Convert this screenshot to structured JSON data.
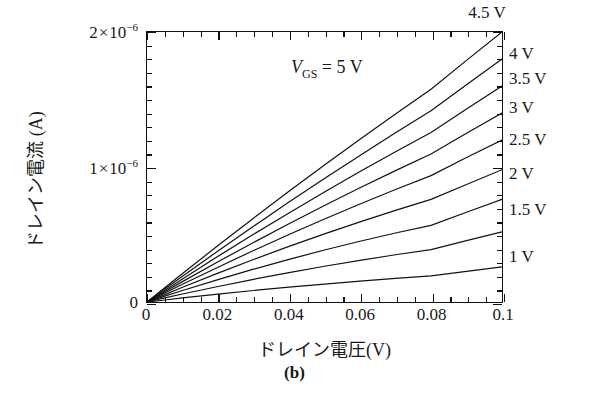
{
  "figure": {
    "panel_caption": "(b)",
    "x_axis_title": "ドレイン電圧(V)",
    "y_axis_title": "ドレイン電流 (A)",
    "annotation": {
      "symbol": "V",
      "subscript": "GS",
      "equals": " = 5 V"
    }
  },
  "axes": {
    "x_tick_labels": [
      "0",
      "0.02",
      "0.04",
      "0.06",
      "0.08",
      "0.1"
    ],
    "y_tick_labels": [
      {
        "mantissa": "0",
        "show_power": false,
        "exponent": ""
      },
      {
        "mantissa": "1",
        "show_power": true,
        "exponent": "−6"
      },
      {
        "mantissa": "2",
        "show_power": true,
        "exponent": "−6"
      }
    ],
    "times_glyph": "×",
    "base": "10"
  },
  "chart_data": {
    "type": "line",
    "title": "",
    "xlabel": "ドレイン電圧(V)",
    "ylabel": "ドレイン電流 (A)",
    "xlim": [
      0,
      0.1
    ],
    "ylim": [
      0,
      2e-06
    ],
    "xticks": [
      0,
      0.02,
      0.04,
      0.06,
      0.08,
      0.1
    ],
    "yticks": [
      0,
      1e-06,
      2e-06
    ],
    "x_minor_step": 0.005,
    "y_minor_step": 1e-07,
    "grid": false,
    "legend": "curve-end-labels-right",
    "x": [
      0,
      0.005,
      0.01,
      0.02,
      0.03,
      0.04,
      0.05,
      0.06,
      0.07,
      0.08,
      0.09,
      0.1
    ],
    "series": [
      {
        "name": "5 V",
        "label": "4.5 V",
        "label_note": "topmost curve is VGS = 5 V, annotated inside plot",
        "values": [
          0,
          1.06e-07,
          2.11e-07,
          4.18e-07,
          6.21e-07,
          8.2e-07,
          1.015e-06,
          1.206e-06,
          1.393e-06,
          1.576e-06,
          1.79e-06,
          2e-06
        ]
      },
      {
        "name": "4.5 V",
        "label": "4.5 V",
        "values": [
          0,
          9.6e-08,
          1.91e-07,
          3.78e-07,
          5.61e-07,
          7.4e-07,
          9.15e-07,
          1.086e-06,
          1.253e-06,
          1.416e-06,
          1.61e-06,
          1.8e-06
        ]
      },
      {
        "name": "4 V",
        "label": "4 V",
        "values": [
          0,
          8.6e-08,
          1.71e-07,
          3.38e-07,
          5.01e-07,
          6.6e-07,
          8.15e-07,
          9.66e-07,
          1.113e-06,
          1.256e-06,
          1.43e-06,
          1.6e-06
        ]
      },
      {
        "name": "3.5 V",
        "label": "3.5 V",
        "values": [
          0,
          7.6e-08,
          1.51e-07,
          2.98e-07,
          4.41e-07,
          5.8e-07,
          7.15e-07,
          8.46e-07,
          9.73e-07,
          1.096e-06,
          1.25e-06,
          1.4e-06
        ]
      },
      {
        "name": "3 V",
        "label": "3 V",
        "values": [
          0,
          6.6e-08,
          1.31e-07,
          2.58e-07,
          3.81e-07,
          5e-07,
          6.15e-07,
          7.26e-07,
          8.33e-07,
          9.36e-07,
          1.07e-06,
          1.2e-06
        ]
      },
      {
        "name": "2.5 V",
        "label": "2.5 V",
        "values": [
          0,
          5.5e-08,
          1.09e-07,
          2.14e-07,
          3.15e-07,
          4.12e-07,
          5.05e-07,
          5.94e-07,
          6.79e-07,
          7.6e-07,
          8.7e-07,
          9.8e-07
        ]
      },
      {
        "name": "2 V",
        "label": "2 V",
        "values": [
          0,
          4.3e-08,
          8.5e-08,
          1.66e-07,
          2.43e-07,
          3.16e-07,
          3.85e-07,
          4.5e-07,
          5.11e-07,
          5.68e-07,
          6.65e-07,
          7.6e-07
        ]
      },
      {
        "name": "1.5 V",
        "label": "1.5 V",
        "values": [
          0,
          3e-08,
          5.9e-08,
          1.15e-07,
          1.68e-07,
          2.18e-07,
          2.65e-07,
          3.09e-07,
          3.5e-07,
          3.88e-07,
          4.55e-07,
          5.2e-07
        ]
      },
      {
        "name": "1 V",
        "label": "1 V",
        "values": [
          0,
          1.5e-08,
          3e-08,
          5.8e-08,
          8.5e-08,
          1.1e-07,
          1.33e-07,
          1.55e-07,
          1.75e-07,
          1.93e-07,
          2.27e-07,
          2.6e-07
        ]
      }
    ]
  },
  "curve_labels": [
    {
      "text": "4.5 V",
      "y": 4,
      "position": "above-top-right"
    },
    {
      "text": "4 V",
      "y": 45
    },
    {
      "text": "3.5 V",
      "y": 70
    },
    {
      "text": "3 V",
      "y": 99
    },
    {
      "text": "2.5 V",
      "y": 131
    },
    {
      "text": "2 V",
      "y": 165
    },
    {
      "text": "1.5 V",
      "y": 201
    },
    {
      "text": "1 V",
      "y": 248
    }
  ]
}
